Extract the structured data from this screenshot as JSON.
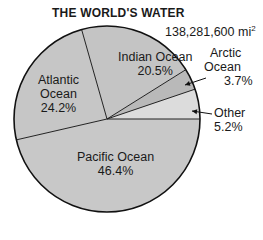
{
  "chart_data": {
    "type": "pie",
    "title": "THE WORLD'S WATER",
    "total": {
      "value": "138,281,600",
      "unit": "mi",
      "unit_exponent": "2"
    },
    "slices": [
      {
        "label": "Other",
        "value": 5.2,
        "display": "5.2%",
        "color": "#dcdcdc"
      },
      {
        "label": "Arctic Ocean",
        "value": 3.7,
        "display": "3.7%",
        "color": "#b9b9b9"
      },
      {
        "label": "Indian Ocean",
        "value": 20.5,
        "display": "20.5%",
        "color": "#c4c4c4"
      },
      {
        "label": "Atlantic Ocean",
        "value": 24.2,
        "display": "24.2%",
        "color": "#c6c6c6"
      },
      {
        "label": "Pacific Ocean",
        "value": 46.4,
        "display": "46.4%",
        "color": "#c8c8c8"
      }
    ],
    "start_angle_deg": 0,
    "direction": "counterclockwise",
    "legend": "none (inline labels)"
  },
  "labels": {
    "indian": {
      "name": "Indian Ocean",
      "pct": "20.5%"
    },
    "atlantic": {
      "line1": "Atlantic",
      "line2": "Ocean",
      "pct": "24.2%"
    },
    "arctic": {
      "line1": "Arctic",
      "line2": "Ocean",
      "pct": "3.7%"
    },
    "other": {
      "name": "Other",
      "pct": "5.2%"
    },
    "pacific": {
      "name": "Pacific Ocean",
      "pct": "46.4%"
    }
  }
}
